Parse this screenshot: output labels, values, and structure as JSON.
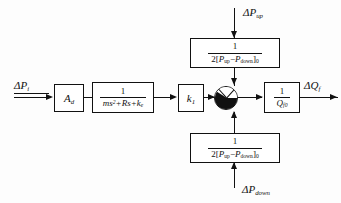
{
  "diagram": {
    "type": "control-block-diagram",
    "background_color": "#fdfdfd",
    "line_color": "#111111",
    "blocks": [
      {
        "id": "gain_ad",
        "label": "A_d",
        "kind": "gain"
      },
      {
        "id": "second_order",
        "label": "1 / (ms^2 + Rs + k_e)",
        "kind": "transfer-function"
      },
      {
        "id": "gain_k1",
        "label": "k_1",
        "kind": "gain"
      },
      {
        "id": "top_feedback",
        "label": "1 / 2[P_up - P_down]_0",
        "kind": "transfer-function"
      },
      {
        "id": "bottom_feedback",
        "label": "1 / 2[P_up - P_down]_0",
        "kind": "transfer-function"
      },
      {
        "id": "output_gain",
        "label": "1 / Q_f0",
        "kind": "transfer-function"
      }
    ],
    "summing_junction": {
      "id": "summer",
      "style": "four-quadrant-pie"
    },
    "signals": {
      "input_left": "ΔP",
      "input_left_sub": "i",
      "input_top": "ΔP",
      "input_top_sub": "up",
      "input_bottom": "ΔP",
      "input_bottom_sub": "down",
      "output_right": "ΔQ",
      "output_right_sub": "f"
    },
    "expressions": {
      "numerator_one": "1",
      "so_den_m": "m",
      "so_den_s2": "s",
      "so_den_s2_exp": "2",
      "so_den_plus1": "+",
      "so_den_R": "R",
      "so_den_s": "s",
      "so_den_plus2": "+",
      "so_den_k": "k",
      "so_den_k_sub": "e",
      "fb_den_two": "2[",
      "fb_den_P1": "P",
      "fb_den_P1_sub": "up",
      "fb_den_minus": "−",
      "fb_den_P2": "P",
      "fb_den_P2_sub": "down",
      "fb_den_close": "]",
      "fb_den_close_sub": "0",
      "out_den_Q": "Q",
      "out_den_Q_sub": "f0",
      "gain_ad_A": "A",
      "gain_ad_sub": "d",
      "gain_k1_k": "k",
      "gain_k1_sub": "1"
    }
  }
}
